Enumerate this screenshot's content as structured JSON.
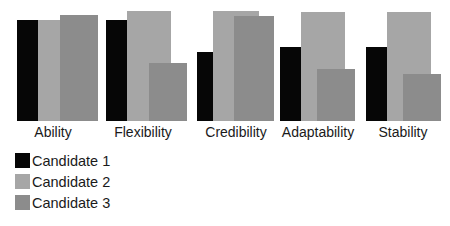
{
  "chart_data": {
    "type": "bar",
    "title": "",
    "xlabel": "",
    "ylabel": "",
    "ylim": [
      0,
      100
    ],
    "grid": false,
    "legend_position": "bottom-left",
    "categories": [
      "Ability",
      "Flexibility",
      "Credibility",
      "Adaptability",
      "Stability"
    ],
    "series": [
      {
        "name": "Candidate 1",
        "color": "#060606",
        "values": [
          92,
          92,
          63,
          67,
          67
        ]
      },
      {
        "name": "Candidate 2",
        "color": "#a6a6a6",
        "values": [
          92,
          100,
          100,
          99,
          99
        ]
      },
      {
        "name": "Candidate 3",
        "color": "#8c8c8c",
        "values": [
          96,
          53,
          95,
          47,
          43
        ]
      }
    ]
  },
  "layout": {
    "baseline_y": 121,
    "plot_height": 110,
    "groups": [
      {
        "c1": [
          17,
          21
        ],
        "c2": [
          38,
          22
        ],
        "c3": [
          60,
          38
        ],
        "label_x": 8
      },
      {
        "c1": [
          106,
          21
        ],
        "c2": [
          127,
          44
        ],
        "c3": [
          149,
          38
        ],
        "label_x": 98
      },
      {
        "c1": [
          197,
          16
        ],
        "c2": [
          213,
          46
        ],
        "c3": [
          234,
          40
        ],
        "label_x": 191
      },
      {
        "c1": [
          280,
          21
        ],
        "c2": [
          301,
          44
        ],
        "c3": [
          317,
          38
        ],
        "label_x": 273
      },
      {
        "c1": [
          366,
          21
        ],
        "c2": [
          387,
          44
        ],
        "c3": [
          403,
          38
        ],
        "label_x": 358
      }
    ]
  }
}
